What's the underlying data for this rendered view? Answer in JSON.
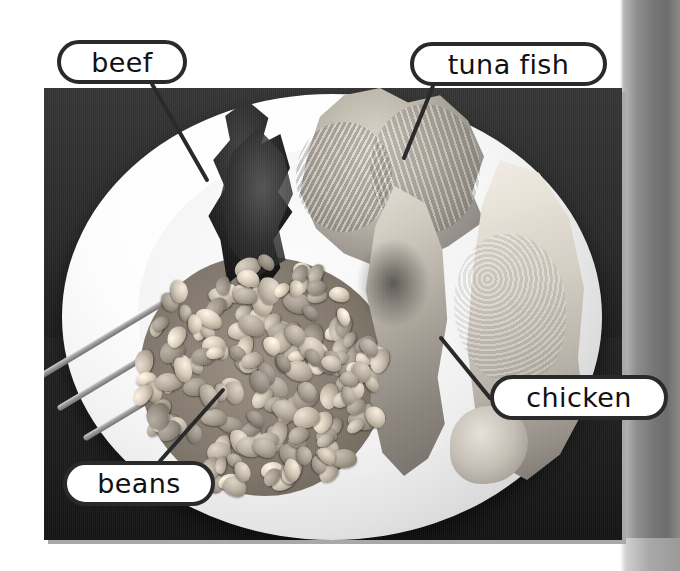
{
  "page": {
    "type": "labelled-photograph-worksheet",
    "background_color": "#ffffff",
    "photo_frame_color": "#2b2b2b",
    "callout_border_color": "#2a2a2a",
    "callout_fill_color": "#ffffff",
    "leader_line_color": "#2a2a2a"
  },
  "photo": {
    "description": "black and white photograph of a white dinner plate holding four kinds of protein food",
    "left": 44,
    "top": 88,
    "width": 578,
    "height": 452,
    "items": [
      {
        "name": "beef",
        "description": "dark roasted sliced beef at the top left of the plate"
      },
      {
        "name": "tuna fish",
        "description": "flaked tuna fish at the top centre of the plate"
      },
      {
        "name": "chicken",
        "description": "two chicken drumsticks on the right of the plate"
      },
      {
        "name": "beans",
        "description": "baked beans in sauce at the lower left of the plate"
      }
    ]
  },
  "callouts": [
    {
      "id": "beef",
      "label": "beef",
      "box": {
        "left": 57,
        "top": 40,
        "width": 130,
        "height": 44
      },
      "leader": {
        "x1": 152,
        "y1": 84,
        "x2": 207,
        "y2": 180
      }
    },
    {
      "id": "tuna-fish",
      "label": "tuna  fish",
      "box": {
        "left": 410,
        "top": 42,
        "width": 197,
        "height": 44
      },
      "leader": {
        "x1": 433,
        "y1": 86,
        "x2": 404,
        "y2": 158
      }
    },
    {
      "id": "chicken",
      "label": "chicken",
      "box": {
        "left": 490,
        "top": 375,
        "width": 178,
        "height": 45
      },
      "leader": {
        "x1": 490,
        "y1": 398,
        "x2": 441,
        "y2": 338
      }
    },
    {
      "id": "beans",
      "label": "beans",
      "box": {
        "left": 63,
        "top": 461,
        "width": 152,
        "height": 45
      },
      "leader": {
        "x1": 160,
        "y1": 461,
        "x2": 223,
        "y2": 390
      }
    }
  ]
}
